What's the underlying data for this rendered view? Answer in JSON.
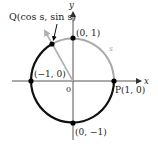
{
  "diagram": {
    "axes": {
      "x_label": "x",
      "y_label": "y",
      "origin_label": "0"
    },
    "points": {
      "Q": {
        "label": "Q(cos s, sin s)"
      },
      "top": {
        "label": "(0, 1)"
      },
      "left": {
        "label": "(−1, 0)"
      },
      "right": {
        "label": "P(1, 0)"
      },
      "bottom": {
        "label": "(0, −1)"
      }
    },
    "arc_label": "s",
    "colors": {
      "circle": "#111111",
      "arc_s": "#aaaaaa",
      "radius_line": "#b0b0b0",
      "axes": "#555555",
      "points": "#000000"
    }
  }
}
